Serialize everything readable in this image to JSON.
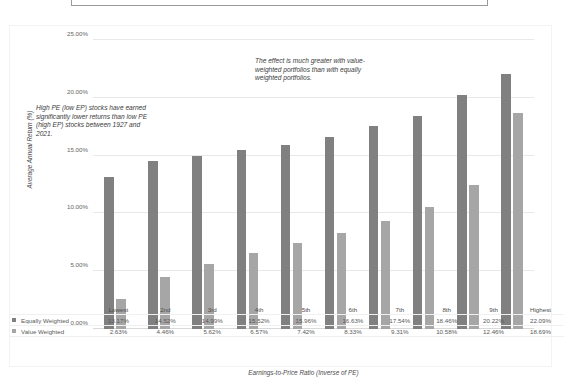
{
  "title_box": {
    "text": ""
  },
  "axes": {
    "y_title": "Average Annual Return (%)",
    "x_title": "Earnings-to-Price Ratio (Inverse of PE)",
    "y_ticks": [
      "0.00%",
      "5.00%",
      "10.00%",
      "15.00%",
      "20.00%",
      "25.00%"
    ]
  },
  "annotations": {
    "left": "High PE (low EP) stocks have earned significantly lower returns than low PE (high EP) stocks between 1927 and 2021.",
    "right": "The effect is much greater with value-weighted portfolios than with equally weighted portfolios."
  },
  "colors": {
    "equally_weighted": "#808080",
    "value_weighted": "#a6a6a6",
    "gridline": "#e8e8e8",
    "text": "#595959"
  },
  "table": {
    "row_labels": [
      "Equally Weighted",
      "Value Weighted"
    ],
    "categories": [
      "Lowest",
      "2nd",
      "3rd",
      "4th",
      "5th",
      "6th",
      "7th",
      "8th",
      "9th",
      "Highest"
    ],
    "rows": [
      [
        "13.17%",
        "14.52%",
        "14.99%",
        "15.52%",
        "15.96%",
        "16.63%",
        "17.54%",
        "18.46%",
        "20.22%",
        "22.09%"
      ],
      [
        "2.63%",
        "4.46%",
        "5.62%",
        "6.57%",
        "7.42%",
        "8.33%",
        "9.31%",
        "10.58%",
        "12.46%",
        "18.69%"
      ]
    ]
  },
  "chart_data": {
    "type": "bar",
    "title": "",
    "xlabel": "Earnings-to-Price Ratio (Inverse of PE)",
    "ylabel": "Average Annual Return (%)",
    "categories": [
      "Lowest",
      "2nd",
      "3rd",
      "4th",
      "5th",
      "6th",
      "7th",
      "8th",
      "9th",
      "Highest"
    ],
    "series": [
      {
        "name": "Equally Weighted",
        "color": "#808080",
        "values": [
          13.17,
          14.52,
          14.99,
          15.52,
          15.96,
          16.63,
          17.54,
          18.46,
          20.22,
          22.09
        ]
      },
      {
        "name": "Value Weighted",
        "color": "#a6a6a6",
        "values": [
          2.63,
          4.46,
          5.62,
          6.57,
          7.42,
          8.33,
          9.31,
          10.58,
          12.46,
          18.69
        ]
      }
    ],
    "ylim": [
      0,
      25
    ],
    "ytick_values": [
      0,
      5,
      10,
      15,
      20,
      25
    ],
    "ytick_format": "percent",
    "grid": true,
    "legend_position": "below-as-data-table",
    "annotations": [
      "High PE (low EP) stocks have earned significantly lower returns than low PE (high EP) stocks between 1927 and 2021.",
      "The effect is much greater with value-weighted portfolios than with equally weighted portfolios."
    ]
  }
}
